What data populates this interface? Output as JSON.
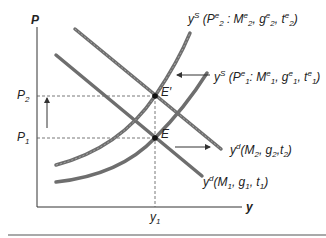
{
  "diagram": {
    "type": "AD-AS shift diagram",
    "axes": {
      "y_label": "P",
      "x_label": "y"
    },
    "price_levels": [
      {
        "label": "P",
        "sub": "2"
      },
      {
        "label": "P",
        "sub": "1"
      }
    ],
    "output_level": {
      "label": "y",
      "sub": "1"
    },
    "equilibria": [
      {
        "label": "E′"
      },
      {
        "label": "E"
      }
    ],
    "curves": {
      "supply_2": {
        "prefix": "y",
        "sup": "S",
        "text": "(P",
        "args": "2:M2,g2,t2",
        "label": "yS (P2e : M2e, g2e, t2e)"
      },
      "supply_1": {
        "label": "yS (P1e : M1e, g1e, t1e)"
      },
      "demand_2": {
        "label": "yd(M2, g2,t2)"
      },
      "demand_1": {
        "label": "yd(M1, g1, t1)"
      }
    },
    "colors": {
      "curve": "#6e6e6e",
      "axis": "#333333",
      "dashed": "#555555",
      "point": "#111111"
    }
  }
}
